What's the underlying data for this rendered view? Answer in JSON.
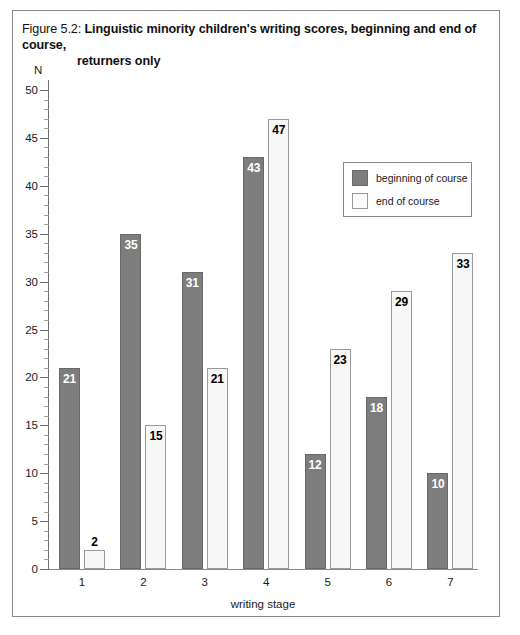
{
  "figure": {
    "number": "Figure 5.2:",
    "title_line1": "Linguistic minority children's writing scores, beginning and end of course,",
    "title_line2": "returners only"
  },
  "chart_data": {
    "type": "bar",
    "title": "Figure 5.2: Linguistic minority children's writing scores, beginning and end of course, returners only",
    "xlabel": "writing stage",
    "ylabel": "N",
    "categories": [
      "1",
      "2",
      "3",
      "4",
      "5",
      "6",
      "7"
    ],
    "series": [
      {
        "name": "beginning of course",
        "color": "#7d7d7d",
        "values": [
          21,
          35,
          31,
          43,
          12,
          18,
          10
        ]
      },
      {
        "name": "end of course",
        "color": "#f7f7f7",
        "values": [
          2,
          15,
          21,
          47,
          23,
          29,
          33
        ]
      }
    ],
    "ylim": [
      0,
      50
    ],
    "y_ticks": [
      0,
      5,
      10,
      15,
      20,
      25,
      30,
      35,
      40,
      45,
      50
    ],
    "y_minor_tick_step": 1,
    "grid": false,
    "legend_position": "upper right",
    "data_labels": true
  },
  "legend": {
    "items": [
      {
        "label": "beginning of course"
      },
      {
        "label": "end of course"
      }
    ]
  }
}
